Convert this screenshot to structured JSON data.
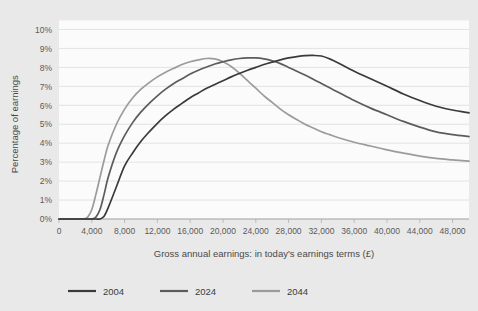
{
  "chart_data": {
    "type": "line",
    "title": "",
    "xlabel": "Gross annual earnings: in today's earnings terms (£)",
    "ylabel": "Percentage of earnings",
    "xlim": [
      0,
      50000
    ],
    "ylim": [
      0,
      10
    ],
    "grid": true,
    "legend_position": "bottom",
    "x_tick_labels": [
      "0",
      "4,000",
      "8,000",
      "12,000",
      "16,000",
      "20,000",
      "24,000",
      "28,000",
      "32,000",
      "36,000",
      "40,000",
      "44,000",
      "48,000"
    ],
    "x_tick_values": [
      0,
      4000,
      8000,
      12000,
      16000,
      20000,
      24000,
      28000,
      32000,
      36000,
      40000,
      44000,
      48000
    ],
    "y_tick_labels": [
      "0%",
      "1%",
      "2%",
      "3%",
      "4%",
      "5%",
      "6%",
      "7%",
      "8%",
      "9%",
      "10%"
    ],
    "y_tick_values": [
      0,
      1,
      2,
      3,
      4,
      5,
      6,
      7,
      8,
      9,
      10
    ],
    "x": [
      0,
      1000,
      2000,
      3000,
      3500,
      4000,
      4500,
      5000,
      5500,
      6000,
      7000,
      8000,
      9000,
      10000,
      11000,
      12000,
      13000,
      14000,
      15000,
      16000,
      17000,
      18000,
      19000,
      20000,
      21000,
      22000,
      23000,
      24000,
      25000,
      26000,
      27000,
      28000,
      29000,
      30000,
      31000,
      32000,
      33000,
      34000,
      36000,
      38000,
      40000,
      42000,
      44000,
      46000,
      48000,
      50000
    ],
    "series": [
      {
        "name": "2004",
        "color": "#3a3a3a",
        "values": [
          0,
          0,
          0,
          0,
          0,
          0,
          0,
          0,
          0.15,
          0.6,
          1.7,
          2.8,
          3.5,
          4.1,
          4.6,
          5.05,
          5.45,
          5.8,
          6.1,
          6.4,
          6.65,
          6.9,
          7.1,
          7.3,
          7.5,
          7.68,
          7.85,
          8.0,
          8.15,
          8.28,
          8.4,
          8.5,
          8.57,
          8.62,
          8.63,
          8.6,
          8.45,
          8.25,
          7.8,
          7.4,
          7.0,
          6.6,
          6.25,
          5.95,
          5.75,
          5.6
        ]
      },
      {
        "name": "2024",
        "color": "#5c5c5c",
        "values": [
          0,
          0,
          0,
          0,
          0,
          0,
          0.1,
          0.5,
          1.3,
          2.2,
          3.5,
          4.4,
          5.1,
          5.65,
          6.1,
          6.5,
          6.85,
          7.15,
          7.4,
          7.65,
          7.85,
          8.02,
          8.18,
          8.3,
          8.4,
          8.47,
          8.5,
          8.5,
          8.45,
          8.35,
          8.2,
          8.0,
          7.8,
          7.6,
          7.38,
          7.15,
          6.92,
          6.7,
          6.25,
          5.85,
          5.5,
          5.15,
          4.85,
          4.6,
          4.45,
          4.35
        ]
      },
      {
        "name": "2044",
        "color": "#9b9b9b",
        "values": [
          0,
          0,
          0,
          0,
          0.1,
          0.5,
          1.3,
          2.2,
          3.1,
          3.9,
          5.0,
          5.8,
          6.4,
          6.85,
          7.2,
          7.5,
          7.75,
          7.95,
          8.15,
          8.3,
          8.4,
          8.47,
          8.45,
          8.3,
          8.05,
          7.7,
          7.3,
          6.9,
          6.5,
          6.15,
          5.8,
          5.5,
          5.25,
          5.0,
          4.8,
          4.6,
          4.45,
          4.3,
          4.05,
          3.85,
          3.65,
          3.48,
          3.32,
          3.2,
          3.12,
          3.05
        ]
      }
    ],
    "legend": [
      {
        "label": "2004",
        "color": "#3a3a3a"
      },
      {
        "label": "2024",
        "color": "#5c5c5c"
      },
      {
        "label": "2044",
        "color": "#9b9b9b"
      }
    ]
  },
  "colors": {
    "background": "#e9e9e9",
    "plot_background": "#fbfbfb",
    "gridline": "#d8d8d8",
    "axis": "#9a9a9a",
    "text": "#4a4a4a"
  }
}
